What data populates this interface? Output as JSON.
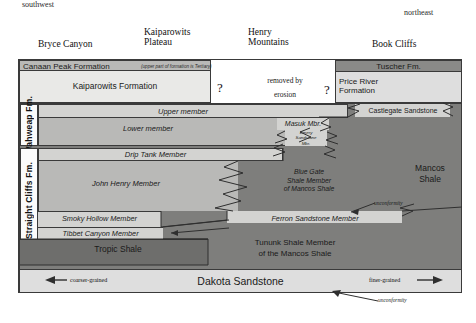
{
  "directions": {
    "left": "southwest",
    "right": "northeast"
  },
  "localities": [
    {
      "name": "Bryce Canyon",
      "lines": [
        "Bryce Canyon"
      ]
    },
    {
      "name": "Kaiparowits Plateau",
      "lines": [
        "Kaiparowits",
        "Plateau"
      ]
    },
    {
      "name": "Henry Mountains",
      "lines": [
        "Henry",
        "Mountains"
      ]
    },
    {
      "name": "Book Cliffs",
      "lines": [
        "Book Cliffs"
      ]
    }
  ],
  "units": {
    "canaan_peak": "Canaan Peak Formation",
    "canaan_peak_note": "(upper part of formation is Tertiary)",
    "kaiparowits": "Kaiparowits Formation",
    "removed_by": "removed by",
    "erosion": "erosion",
    "question_left": "?",
    "question_right": "?",
    "tuscher": "Tuscher Fm.",
    "price_river": [
      "Price River",
      "Formation"
    ],
    "wahweap_fm": "Wahweap Fm.",
    "upper_member": "Upper member",
    "lower_member": "Lower member",
    "castlegate": "Castlegate Sandstone",
    "masuk": "Masuk Mbr.",
    "emery": [
      "Emery",
      "Sandstone",
      "Mbr."
    ],
    "straight_cliffs_fm": "Straight Cliffs Fm.",
    "drip_tank": "Drip Tank Member",
    "john_henry": "John Henry Member",
    "blue_gate": [
      "Blue Gate",
      "Shale Member",
      "of Mancos Shale"
    ],
    "mancos_shale": [
      "Mancos",
      "Shale"
    ],
    "smoky_hollow": "Smoky Hollow Member",
    "ferron": "Ferron Sandstone Member",
    "tibbet_canyon": "Tibbet Canyon Member",
    "tropic_shale": "Tropic Shale",
    "tununk": [
      "Tununk Shale Member",
      "of the Mancos Shale"
    ],
    "dakota": "Dakota Sandstone"
  },
  "annotations": {
    "unconformity_mid": "unconformity",
    "unconformity_bottom": "unconformity",
    "coarser": "coarser-grained",
    "finer": "finer-grained"
  },
  "colors": {
    "ink": "#3a3a3a",
    "paper": "#ffffff",
    "fill_light": "#dedede",
    "fill_mid": "#b9b9b7",
    "fill_dark": "#8a8a88"
  }
}
